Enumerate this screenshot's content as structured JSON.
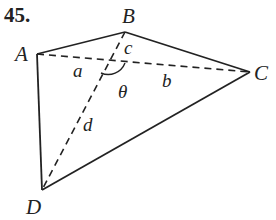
{
  "problem_number": "45.",
  "vertices": {
    "A": {
      "label": "A",
      "x": 37,
      "y": 54
    },
    "B": {
      "label": "B",
      "x": 125,
      "y": 32
    },
    "C": {
      "label": "C",
      "x": 250,
      "y": 72
    },
    "D": {
      "label": "D",
      "x": 42,
      "y": 190
    }
  },
  "intersection": {
    "x": 107,
    "y": 61
  },
  "segment_labels": {
    "a": "a",
    "b": "b",
    "c": "c",
    "d": "d"
  },
  "angle_label": "θ",
  "colors": {
    "line": "#222222",
    "background": "#ffffff"
  }
}
